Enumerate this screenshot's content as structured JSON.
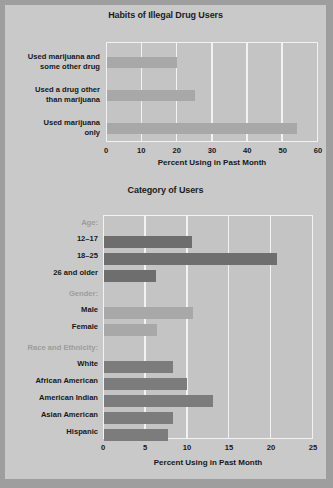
{
  "figure": {
    "background_color": "#c9c9c9",
    "border_color": "#9e9e9e",
    "plot_background_color": "#c4c4c4",
    "gridline_color": "#f2f2f2"
  },
  "chart_data": [
    {
      "type": "bar",
      "orientation": "horizontal",
      "title": "Habits of Illegal Drug Users",
      "xlabel": "Percent Using in Past Month",
      "ylabel": "",
      "xlim": [
        0,
        60
      ],
      "xticks": [
        0,
        10,
        20,
        30,
        40,
        50,
        60
      ],
      "xtick_labels": [
        "0",
        "10",
        "20",
        "30",
        "40",
        "50",
        "60"
      ],
      "grid": true,
      "legend": "none",
      "bar_color": "#a8a8a8",
      "categories": [
        "Used marijuana and some other drug",
        "Used a drug other than marijuana",
        "Used marijuana only"
      ],
      "category_lines": [
        [
          "Used marijuana and",
          "some other drug"
        ],
        [
          "Used a drug other",
          "than marijuana"
        ],
        [
          "Used marijuana",
          "only"
        ]
      ],
      "values": [
        20,
        25,
        54
      ]
    },
    {
      "type": "bar",
      "orientation": "horizontal",
      "title": "Category of Users",
      "xlabel": "Percent Using in Past Month",
      "ylabel": "",
      "xlim": [
        0,
        25
      ],
      "xticks": [
        0,
        5,
        10,
        15,
        20,
        25
      ],
      "xtick_labels": [
        "0",
        "5",
        "10",
        "15",
        "20",
        "25"
      ],
      "grid": true,
      "legend": "none",
      "group_label_color": "#9c9c9c",
      "groups": [
        {
          "name": "Age:",
          "bar_color": "#6e6e6e",
          "categories": [
            "12–17",
            "18–25",
            "26 and older"
          ],
          "values": [
            10.5,
            20.7,
            6.2
          ]
        },
        {
          "name": "Gender:",
          "bar_color": "#a8a8a8",
          "categories": [
            "Male",
            "Female"
          ],
          "values": [
            10.6,
            6.3
          ]
        },
        {
          "name": "Race and Ethnicity:",
          "bar_color": "#7c7c7c",
          "categories": [
            "White",
            "African American",
            "American Indian",
            "Asian American",
            "Hispanic"
          ],
          "values": [
            8.2,
            9.9,
            13.0,
            8.2,
            7.6
          ]
        }
      ]
    }
  ]
}
